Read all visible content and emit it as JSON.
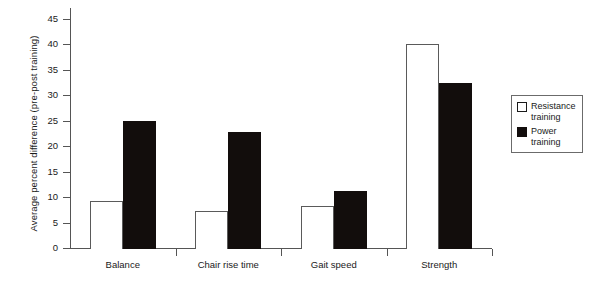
{
  "chart_data": {
    "type": "bar",
    "title": "",
    "xlabel": "",
    "ylabel": "Average percent difference (pre-post training)",
    "ylim": [
      0,
      45
    ],
    "yticks": [
      0,
      5,
      10,
      15,
      20,
      25,
      30,
      35,
      40,
      45
    ],
    "grid": false,
    "legend_position": "right",
    "categories": [
      "Balance",
      "Chair rise time",
      "Gait speed",
      "Strength"
    ],
    "series": [
      {
        "name": "Resistance training",
        "color": "#ffffff",
        "edge_color": "#5a5a5a",
        "values": [
          9.3,
          7.2,
          8.3,
          40.0
        ]
      },
      {
        "name": "Power training",
        "color": "#120d0c",
        "edge_color": "#120d0c",
        "values": [
          25.0,
          22.7,
          11.2,
          32.5
        ]
      }
    ]
  },
  "legend": {
    "items": [
      {
        "label_line1": "Resistance",
        "label_line2": "training",
        "swatch": "white-square"
      },
      {
        "label_line1": "Power",
        "label_line2": "training",
        "swatch": "black-square"
      }
    ]
  }
}
